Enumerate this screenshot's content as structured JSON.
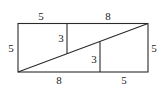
{
  "diagram": {
    "rectangle": {
      "width_units": 13,
      "height_units": 5
    },
    "labels": {
      "top_left": "5",
      "top_right": "8",
      "left_side": "5",
      "right_side": "5",
      "bottom_left": "8",
      "bottom_right": "5",
      "upper_vertical": "3",
      "lower_vertical": "3"
    },
    "colors": {
      "line": "#2a2a2a",
      "text": "#222222",
      "background": "#ffffff"
    }
  }
}
